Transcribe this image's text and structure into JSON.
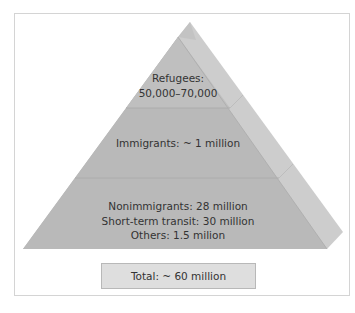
{
  "diagram": {
    "type": "pyramid",
    "levels": [
      {
        "id": "top",
        "lines": [
          "Refugees:",
          "50,000–70,000"
        ]
      },
      {
        "id": "middle",
        "lines": [
          "Immigrants: ~ 1 million"
        ]
      },
      {
        "id": "bottom",
        "lines": [
          "Nonimmigrants: 28 million",
          "Short-term transit: 30 million",
          "Others: 1.5 milion"
        ]
      }
    ],
    "total": "Total: ~ 60 million",
    "colors": {
      "front_face": "#b9b9b9",
      "side_face": "#cdcdcd",
      "divider": "#acacac",
      "total_box": "#dedede",
      "frame_border": "#d4d4d4",
      "text": "#333333"
    }
  }
}
